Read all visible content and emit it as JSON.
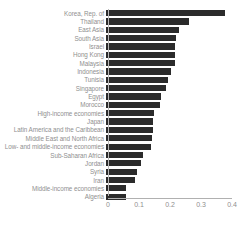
{
  "chart_data": {
    "type": "bar",
    "orientation": "horizontal",
    "title": "",
    "subtitle": "",
    "xlabel": "",
    "ylabel": "",
    "xlim": [
      0,
      0.4
    ],
    "grid": false,
    "legend": null,
    "bar_color": "#2b2b2b",
    "text_color": "#8f8f8f",
    "axis_color": "#b0b0b0",
    "xticks": [
      "0",
      "0.1",
      "0.2",
      "0.3",
      "0.4"
    ],
    "xtick_values": [
      0,
      0.1,
      0.2,
      0.3,
      0.4
    ],
    "categories": [
      "Korea, Rep. of",
      "Thailand",
      "East Asia",
      "South Asia",
      "Israel",
      "Hong Kong",
      "Malaysia",
      "Indonesia",
      "Tunisia",
      "Singapore",
      "Egypt",
      "Morocco",
      "High-income economies",
      "Japan",
      "Latin America and the Caribbean",
      "Middle East and North Africa",
      "Low- and middle-income economies",
      "Sub-Saharan Africa",
      "Jordan",
      "Syria",
      "Iran",
      "Middle-income economies",
      "Algeria"
    ],
    "values": [
      0.385,
      0.268,
      0.235,
      0.227,
      0.223,
      0.222,
      0.221,
      0.21,
      0.2,
      0.192,
      0.178,
      0.175,
      0.156,
      0.153,
      0.152,
      0.148,
      0.144,
      0.12,
      0.112,
      0.1,
      0.092,
      0.065,
      0.063
    ]
  }
}
